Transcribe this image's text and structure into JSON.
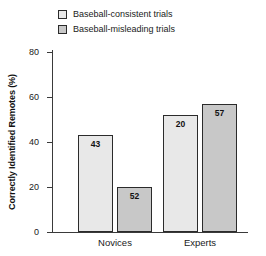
{
  "chart_data": {
    "type": "bar",
    "title": "",
    "xlabel": "",
    "ylabel": "Correctly Identified Remotes (%)",
    "categories": [
      "Novices",
      "Experts"
    ],
    "series": [
      {
        "name": "Baseball-consistent trials",
        "values": [
          43,
          52
        ],
        "color": "#e8e8e8"
      },
      {
        "name": "Baseball-misleading trials",
        "values": [
          20,
          57
        ],
        "color": "#c8c8c8"
      }
    ],
    "ylim": [
      0,
      80
    ],
    "yticks": [
      0,
      20,
      40,
      60,
      80
    ],
    "ytick_labels": [
      "0",
      "20",
      "40",
      "60",
      "80"
    ],
    "grid": false,
    "legend_position": "top-left",
    "data_labels": [
      {
        "group": "Novices",
        "series": "Baseball-consistent trials",
        "value": 43
      },
      {
        "group": "Novices",
        "series": "Baseball-misleading trials",
        "value": 52
      },
      {
        "group": "Experts",
        "series": "Baseball-consistent trials",
        "value": 20
      },
      {
        "group": "Experts",
        "series": "Baseball-misleading trials",
        "value": 57
      }
    ]
  },
  "legend": {
    "items": [
      {
        "label": "Baseball-consistent trials",
        "color": "#e8e8e8"
      },
      {
        "label": "Baseball-misleading trials",
        "color": "#c8c8c8"
      }
    ]
  },
  "axes": {
    "y_title": "Correctly Identified Remotes (%)",
    "y_ticks": [
      "80",
      "60",
      "40",
      "20",
      "0"
    ],
    "x_categories": [
      "Novices",
      "Experts"
    ]
  },
  "bars": [
    {
      "value": "43",
      "label": "43"
    },
    {
      "value": "52",
      "label": "52"
    },
    {
      "value": "20",
      "label": "20"
    },
    {
      "value": "57",
      "label": "57"
    }
  ],
  "colors": {
    "bar_light": "#e8e8e8",
    "bar_dark": "#c8c8c8",
    "bar_border": "#2b2b2b",
    "axis": "#3a3a3a",
    "text": "#1a1a1a",
    "background": "#ffffff"
  }
}
